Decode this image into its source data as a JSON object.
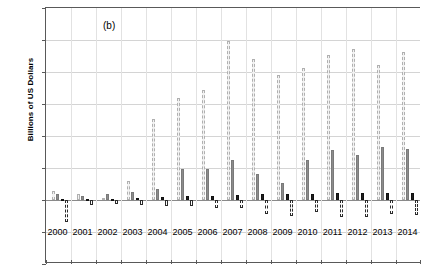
{
  "panel_label": "(b)",
  "axis": {
    "ylabel": "Billions of US Dollars",
    "yticks": [
      300,
      250,
      200,
      150,
      100,
      50,
      0,
      -50,
      -100
    ],
    "ymin": -100,
    "ymax": 300
  },
  "colors": {
    "series1": "#f2f2f2",
    "series1_outline": "#b0b0b0",
    "series2": "#8c8c8c",
    "series3": "#1f1f1f",
    "series4": "#fdfdfd",
    "series4_outline": "#2b2b2b",
    "grid": "#d4d4d4",
    "frame": "#595959"
  },
  "chart_data": {
    "type": "bar",
    "title": "",
    "xlabel": "",
    "ylabel": "Billions of US Dollars",
    "ylim": [
      -100,
      300
    ],
    "yticks": [
      -100,
      -50,
      0,
      50,
      100,
      150,
      200,
      250,
      300
    ],
    "grid": true,
    "legend": "none",
    "annotations": [
      "(b)"
    ],
    "categories": [
      "2000",
      "2001",
      "2002",
      "2003",
      "2004",
      "2005",
      "2006",
      "2007",
      "2008",
      "2009",
      "2010",
      "2011",
      "2012",
      "2013",
      "2014"
    ],
    "series": [
      {
        "name": "series-1",
        "style": "light-dashed-outline",
        "values": [
          14,
          9,
          3,
          29,
          126,
          160,
          172,
          249,
          221,
          196,
          207,
          226,
          236,
          211,
          232
        ]
      },
      {
        "name": "series-2",
        "style": "solid-grey",
        "values": [
          9,
          7,
          9,
          12,
          17,
          48,
          49,
          62,
          40,
          27,
          62,
          78,
          70,
          83,
          80
        ]
      },
      {
        "name": "series-3",
        "style": "solid-black",
        "values": [
          2,
          1,
          2,
          3,
          5,
          6,
          6,
          8,
          10,
          9,
          10,
          11,
          11,
          11,
          11
        ]
      },
      {
        "name": "series-4",
        "style": "white-dashed-outline-negative",
        "values": [
          -35,
          -8,
          -6,
          -8,
          -9,
          -10,
          -12,
          -13,
          -22,
          -25,
          -19,
          -26,
          -27,
          -22,
          -24
        ]
      }
    ]
  }
}
